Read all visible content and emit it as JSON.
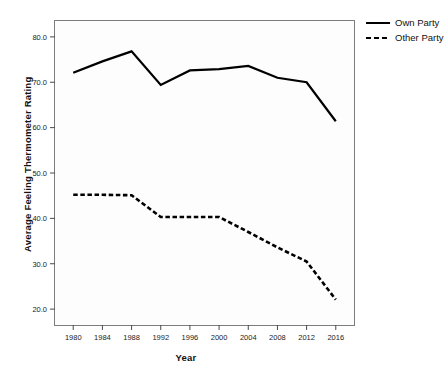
{
  "chart_data": {
    "type": "line",
    "title": "",
    "xlabel": "Year",
    "ylabel": "Average Feeling Thermometer Rating",
    "x": [
      1980,
      1984,
      1988,
      1992,
      1996,
      2000,
      2004,
      2008,
      2012,
      2016
    ],
    "xtick_labels": [
      "1980",
      "1984",
      "1988",
      "1992",
      "1996",
      "2000",
      "2004",
      "2008",
      "2012",
      "2016"
    ],
    "ytick_labels": [
      "20.0",
      "30.0",
      "40.0",
      "50.0",
      "60.0",
      "70.0",
      "80.0"
    ],
    "yticks": [
      20,
      30,
      40,
      50,
      60,
      70,
      80
    ],
    "ylim": [
      16.5,
      83.5
    ],
    "xlim": [
      1977.5,
      2018.5
    ],
    "grid": false,
    "legend_position": "right",
    "series": [
      {
        "name": "Own Party",
        "style": "solid",
        "color": "#000000",
        "values": [
          72.1,
          74.6,
          76.8,
          69.4,
          72.6,
          72.9,
          73.6,
          71.0,
          70.0,
          61.4
        ]
      },
      {
        "name": "Other Party",
        "style": "dashed",
        "color": "#000000",
        "values": [
          45.2,
          45.2,
          45.1,
          40.3,
          40.3,
          40.3,
          37.0,
          33.6,
          30.5,
          22.1
        ]
      }
    ]
  },
  "legend": {
    "items": [
      {
        "label": "Own Party",
        "style": "solid"
      },
      {
        "label": "Other Party",
        "style": "dashed"
      }
    ]
  },
  "axes": {
    "x_title": "Year",
    "y_title": "Average Feeling Thermometer Rating"
  }
}
